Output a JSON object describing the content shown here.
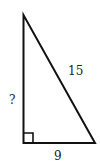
{
  "diagram": {
    "type": "right-triangle",
    "labels": {
      "vertical_leg": "?",
      "hypotenuse": "15",
      "horizontal_leg": "9"
    },
    "right_angle_marker": "bottom-left",
    "stroke_color": "#111111"
  }
}
